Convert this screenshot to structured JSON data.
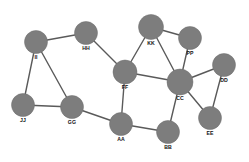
{
  "figure": {
    "type": "node-link-network-graph",
    "width": 249,
    "height": 162,
    "background_color": "#ffffff",
    "node_color": "#7d7d7d",
    "edge_color": "#5a5a5a",
    "label_color": "#111111"
  },
  "chart_data": {
    "type": "diagram",
    "subtype": "network-graph",
    "title": "",
    "directed": false,
    "node_count": 12,
    "edge_count": 16,
    "nodes": [
      {
        "id": "II",
        "label": "II",
        "x": 36,
        "y": 42,
        "r": 11.5,
        "label_x": 36,
        "label_y": 58,
        "degree": 3
      },
      {
        "id": "HH",
        "label": "HH",
        "x": 86,
        "y": 33,
        "r": 11.5,
        "label_x": 86,
        "label_y": 49,
        "degree": 2
      },
      {
        "id": "KK",
        "label": "KK",
        "x": 151,
        "y": 27,
        "r": 12.5,
        "label_x": 151,
        "label_y": 44,
        "degree": 4
      },
      {
        "id": "PP",
        "label": "PP",
        "x": 190,
        "y": 38,
        "r": 11.5,
        "label_x": 190,
        "label_y": 54,
        "degree": 2
      },
      {
        "id": "DD",
        "label": "DD",
        "x": 224,
        "y": 65,
        "r": 11.5,
        "label_x": 224,
        "label_y": 81,
        "degree": 2
      },
      {
        "id": "FF",
        "label": "FF",
        "x": 125,
        "y": 72,
        "r": 12.0,
        "label_x": 125,
        "label_y": 88,
        "degree": 4
      },
      {
        "id": "CC",
        "label": "CC",
        "x": 180,
        "y": 82,
        "r": 13.0,
        "label_x": 180,
        "label_y": 99,
        "degree": 6
      },
      {
        "id": "EE",
        "label": "EE",
        "x": 210,
        "y": 118,
        "r": 11.5,
        "label_x": 210,
        "label_y": 134,
        "degree": 2
      },
      {
        "id": "JJ",
        "label": "JJ",
        "x": 23,
        "y": 105,
        "r": 11.5,
        "label_x": 23,
        "label_y": 121,
        "degree": 2
      },
      {
        "id": "GG",
        "label": "GG",
        "x": 72,
        "y": 107,
        "r": 11.5,
        "label_x": 72,
        "label_y": 123,
        "degree": 3
      },
      {
        "id": "AA",
        "label": "AA",
        "x": 121,
        "y": 124,
        "r": 11.5,
        "label_x": 121,
        "label_y": 140,
        "degree": 3
      },
      {
        "id": "BB",
        "label": "BB",
        "x": 168,
        "y": 132,
        "r": 11.5,
        "label_x": 168,
        "label_y": 148,
        "degree": 2
      }
    ],
    "edges": [
      {
        "source": "II",
        "target": "HH"
      },
      {
        "source": "II",
        "target": "JJ"
      },
      {
        "source": "II",
        "target": "GG"
      },
      {
        "source": "HH",
        "target": "FF"
      },
      {
        "source": "JJ",
        "target": "GG"
      },
      {
        "source": "GG",
        "target": "AA"
      },
      {
        "source": "FF",
        "target": "KK"
      },
      {
        "source": "FF",
        "target": "CC"
      },
      {
        "source": "FF",
        "target": "AA"
      },
      {
        "source": "KK",
        "target": "PP"
      },
      {
        "source": "KK",
        "target": "CC"
      },
      {
        "source": "PP",
        "target": "CC"
      },
      {
        "source": "CC",
        "target": "DD"
      },
      {
        "source": "CC",
        "target": "EE"
      },
      {
        "source": "CC",
        "target": "BB"
      },
      {
        "source": "AA",
        "target": "BB"
      },
      {
        "source": "DD",
        "target": "EE"
      }
    ]
  }
}
